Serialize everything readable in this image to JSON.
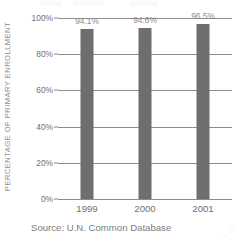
{
  "chart_data": {
    "type": "bar",
    "title": "",
    "xlabel": "",
    "ylabel": "PERCENTAGE OF PRIMARY ENROLLMENT",
    "categories": [
      "1999",
      "2000",
      "2001"
    ],
    "values": [
      94.1,
      94.6,
      96.5
    ],
    "value_labels": [
      "94.1%",
      "94.6%",
      "96.5%"
    ],
    "ylim": [
      0,
      100
    ],
    "yticks": [
      0,
      20,
      40,
      60,
      80,
      100
    ],
    "ytick_labels": [
      "0%",
      "20%",
      "40%",
      "60%",
      "80%",
      "100%"
    ],
    "grid": true,
    "legend": "none",
    "bar_color": "#6e6e6e",
    "gridline_color": "#8c8c8c",
    "text_color": "#6f6f6f",
    "label_color": "#8d8d8d"
  },
  "caption": {
    "source": "Source: U.N. Common Database"
  }
}
